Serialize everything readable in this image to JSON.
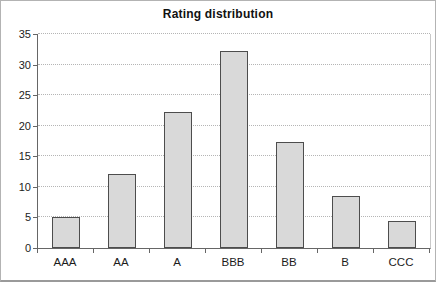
{
  "figure": {
    "kind": "embedded-excel-style-bar-chart"
  },
  "chart_data": {
    "type": "bar",
    "title": "Rating distribution",
    "categories": [
      "AAA",
      "AA",
      "A",
      "BBB",
      "BB",
      "B",
      "CCC"
    ],
    "values": [
      5.0,
      12.1,
      22.2,
      32.3,
      17.4,
      8.5,
      4.4
    ],
    "xlabel": "",
    "ylabel": "",
    "ylim": [
      0,
      35
    ],
    "ytick_step": 5,
    "ytick_labels": [
      "0",
      "5",
      "10",
      "15",
      "20",
      "25",
      "30",
      "35"
    ],
    "grid": "horizontal-dotted",
    "legend": "none",
    "colors": {
      "bar_fill": "#d9d9d9",
      "bar_border": "#4d4d4d",
      "gridline": "#b5b5b5",
      "axis": "#666666",
      "text": "#1c1c1c",
      "frame_border": "#b3b3b3",
      "bottom_rule": "#9a9a9a",
      "background": "#ffffff"
    }
  }
}
